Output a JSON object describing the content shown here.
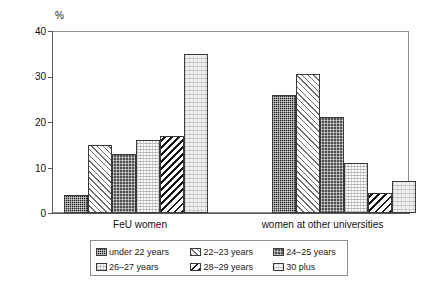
{
  "chart_data": {
    "type": "bar",
    "title": "",
    "xlabel": "",
    "ylabel": "%",
    "ylim": [
      0,
      40
    ],
    "yticks": [
      0,
      10,
      20,
      30,
      40
    ],
    "grid": false,
    "legend_position": "below",
    "categories": [
      "FeU women",
      "women at other universities"
    ],
    "series": [
      {
        "name": "under 22 years",
        "values": [
          4,
          26
        ]
      },
      {
        "name": "22‒23 years",
        "values": [
          15,
          30.5
        ]
      },
      {
        "name": "24‒25 years",
        "values": [
          13,
          21
        ]
      },
      {
        "name": "26‒27 years",
        "values": [
          16,
          11
        ]
      },
      {
        "name": "28‒29 years",
        "values": [
          17,
          4.5
        ]
      },
      {
        "name": "30 plus",
        "values": [
          35,
          7
        ]
      }
    ]
  },
  "axis": {
    "unit_label": "%",
    "tick_0": "0",
    "tick_1": "10",
    "tick_2": "20",
    "tick_3": "30",
    "tick_4": "40"
  },
  "groups": {
    "g0_label": "FeU women",
    "g1_label": "women at other universities"
  },
  "legend": {
    "item_0": "under 22 years",
    "item_1": "22‒23 years",
    "item_2": "24‒25 years",
    "item_3": "26‒27 years",
    "item_4": "28‒29 years",
    "item_5": "30 plus"
  }
}
